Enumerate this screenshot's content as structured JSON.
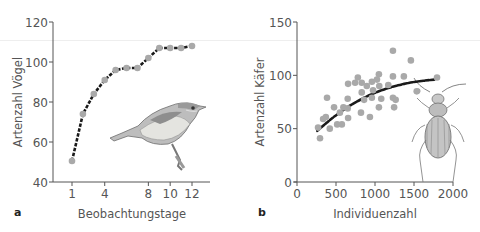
{
  "chart_data": [
    {
      "panel": "a",
      "type": "line",
      "title": "",
      "xlabel": "Beobachtungstage",
      "ylabel": "Artenzahl Vögel",
      "xlim": [
        0,
        14
      ],
      "ylim": [
        40,
        120
      ],
      "x_ticks": [
        "1",
        "4",
        "8",
        "10",
        "12"
      ],
      "x_tick_values": [
        1,
        4,
        8,
        10,
        12
      ],
      "y_ticks": [
        "40",
        "60",
        "80",
        "100",
        "120"
      ],
      "y_tick_values": [
        40,
        60,
        80,
        100,
        120
      ],
      "grid": false,
      "illustration": "bird-icon",
      "series": [
        {
          "name": "Artenzahl Vögel",
          "x": [
            1,
            2,
            3,
            4,
            5,
            6,
            7,
            8,
            9,
            10,
            11,
            12
          ],
          "values": [
            50.5,
            74,
            84,
            91,
            96,
            97,
            97,
            102,
            107,
            107,
            107,
            108
          ]
        }
      ]
    },
    {
      "panel": "b",
      "type": "scatter",
      "title": "",
      "xlabel": "Individuenzahl",
      "ylabel": "Artenzahl Käfer",
      "xlim": [
        0,
        2000
      ],
      "ylim": [
        0,
        150
      ],
      "x_ticks": [
        "0",
        "500",
        "1000",
        "1500",
        "2000"
      ],
      "x_tick_values": [
        0,
        500,
        1000,
        1500,
        2000
      ],
      "y_ticks": [
        "0",
        "50",
        "100",
        "150"
      ],
      "y_tick_values": [
        0,
        50,
        100,
        150
      ],
      "grid": false,
      "illustration": "beetle-icon",
      "series": [
        {
          "name": "Probeflächen",
          "points": [
            [
              270,
              51
            ],
            [
              295,
              41
            ],
            [
              385,
              79
            ],
            [
              370,
              61
            ],
            [
              420,
              50
            ],
            [
              335,
              59
            ],
            [
              475,
              70
            ],
            [
              515,
              54
            ],
            [
              550,
              65
            ],
            [
              575,
              54
            ],
            [
              595,
              70
            ],
            [
              650,
              78
            ],
            [
              655,
              92
            ],
            [
              655,
              60
            ],
            [
              650,
              69
            ],
            [
              745,
              93
            ],
            [
              780,
              98
            ],
            [
              830,
              93
            ],
            [
              830,
              84
            ],
            [
              820,
              65
            ],
            [
              860,
              77
            ],
            [
              895,
              90
            ],
            [
              935,
              61
            ],
            [
              960,
              94
            ],
            [
              960,
              79
            ],
            [
              975,
              86
            ],
            [
              1025,
              96
            ],
            [
              1050,
              101
            ],
            [
              1055,
              90
            ],
            [
              1080,
              78
            ],
            [
              1050,
              70
            ],
            [
              1170,
              91
            ],
            [
              1230,
              123
            ],
            [
              1230,
              99
            ],
            [
              1230,
              79
            ],
            [
              1245,
              70
            ],
            [
              1265,
              77
            ],
            [
              1370,
              99
            ],
            [
              1460,
              114
            ],
            [
              1535,
              85
            ],
            [
              1795,
              98
            ]
          ]
        },
        {
          "name": "Trend",
          "type": "line",
          "x": [
            260,
            500,
            750,
            1000,
            1250,
            1500,
            1760
          ],
          "values": [
            48,
            63,
            75,
            84,
            90,
            94,
            96
          ]
        }
      ]
    }
  ],
  "labels": {
    "panel_a": "a",
    "panel_b": "b",
    "a_xlabel": "Beobachtungstage",
    "a_ylabel": "Artenzahl Vögel",
    "b_xlabel": "Individuenzahl",
    "b_ylabel": "Artenzahl Käfer"
  },
  "colors": {
    "axis": "#555555",
    "marker": "#a9a9a9",
    "line": "#1a1a1a"
  }
}
